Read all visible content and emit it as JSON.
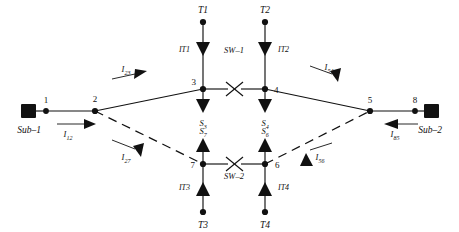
{
  "diagram": {
    "type": "single-line-diagram",
    "colors": {
      "line": "#111111",
      "background": "#ffffff"
    },
    "substations": [
      {
        "id": "sub1",
        "label": "Sub–1",
        "x": 29,
        "y": 111
      },
      {
        "id": "sub2",
        "label": "Sub–2",
        "x": 430,
        "y": 111
      }
    ],
    "nodes": [
      {
        "id": "n1",
        "label": "1",
        "x": 46,
        "y": 111
      },
      {
        "id": "n2",
        "label": "2",
        "x": 95,
        "y": 111
      },
      {
        "id": "n3",
        "label": "3",
        "x": 203,
        "y": 89
      },
      {
        "id": "n4",
        "label": "4",
        "x": 265,
        "y": 89
      },
      {
        "id": "n5",
        "label": "5",
        "x": 370,
        "y": 111
      },
      {
        "id": "n6",
        "label": "6",
        "x": 265,
        "y": 164
      },
      {
        "id": "n7",
        "label": "7",
        "x": 203,
        "y": 164
      },
      {
        "id": "n8",
        "label": "8",
        "x": 415,
        "y": 111
      }
    ],
    "terminals": [
      {
        "id": "t1",
        "label": "T1",
        "x": 203,
        "y": 22,
        "label_y": 12
      },
      {
        "id": "t2",
        "label": "T2",
        "x": 265,
        "y": 22,
        "label_y": 12
      },
      {
        "id": "t3",
        "label": "T3",
        "x": 203,
        "y": 212,
        "label_y": 226
      },
      {
        "id": "t4",
        "label": "T4",
        "x": 265,
        "y": 212,
        "label_y": 226
      }
    ],
    "transfer_loads": [
      {
        "id": "it1",
        "label": "IT1",
        "direction": "down",
        "x": 203,
        "y": 48
      },
      {
        "id": "it2",
        "label": "IT2",
        "direction": "down",
        "x": 265,
        "y": 48
      },
      {
        "id": "it3",
        "label": "IT3",
        "direction": "up",
        "x": 203,
        "y": 188
      },
      {
        "id": "it4",
        "label": "IT4",
        "direction": "up",
        "x": 265,
        "y": 188
      }
    ],
    "loads": [
      {
        "id": "s3",
        "label": "S",
        "sub": "3",
        "direction": "down",
        "x": 203,
        "y": 101
      },
      {
        "id": "s4",
        "label": "S",
        "sub": "4",
        "direction": "down",
        "x": 265,
        "y": 101
      },
      {
        "id": "s7",
        "label": "S",
        "sub": "7",
        "direction": "up",
        "x": 203,
        "y": 142
      },
      {
        "id": "s6",
        "label": "S",
        "sub": "6",
        "direction": "up",
        "x": 265,
        "y": 142
      }
    ],
    "switches": [
      {
        "id": "sw1",
        "label": "SW–1",
        "state": "open",
        "x": 234,
        "y": 89,
        "label_y": 50
      },
      {
        "id": "sw2",
        "label": "SW–2",
        "state": "open",
        "x": 234,
        "y": 164,
        "label_y": 176
      }
    ],
    "currents": [
      {
        "id": "i12",
        "label": "I",
        "sub": "12",
        "from": "1",
        "to": "2",
        "x": 72,
        "y": 131
      },
      {
        "id": "i23",
        "label": "I",
        "sub": "23",
        "from": "2",
        "to": "3",
        "x": 129,
        "y": 70
      },
      {
        "id": "i27",
        "label": "I",
        "sub": "27",
        "from": "2",
        "to": "7",
        "x": 128,
        "y": 158
      },
      {
        "id": "i54",
        "label": "I",
        "sub": "54",
        "from": "5",
        "to": "4",
        "x": 329,
        "y": 71
      },
      {
        "id": "i56",
        "label": "I",
        "sub": "56",
        "from": "6",
        "to": "5",
        "x": 318,
        "y": 157
      },
      {
        "id": "i85",
        "label": "I",
        "sub": "85",
        "from": "8",
        "to": "5",
        "x": 394,
        "y": 131
      }
    ],
    "edges": [
      {
        "id": "e-sub1-1",
        "style": "solid"
      },
      {
        "id": "e-1-2",
        "style": "solid"
      },
      {
        "id": "e-2-3",
        "style": "solid"
      },
      {
        "id": "e-2-7",
        "style": "dashed"
      },
      {
        "id": "e-3-sw1",
        "style": "solid"
      },
      {
        "id": "e-sw1-4",
        "style": "solid"
      },
      {
        "id": "e-7-sw2",
        "style": "solid"
      },
      {
        "id": "e-sw2-6",
        "style": "solid"
      },
      {
        "id": "e-4-5",
        "style": "solid"
      },
      {
        "id": "e-6-5",
        "style": "dashed"
      },
      {
        "id": "e-5-8",
        "style": "solid"
      },
      {
        "id": "e-8-sub2",
        "style": "solid"
      }
    ]
  }
}
